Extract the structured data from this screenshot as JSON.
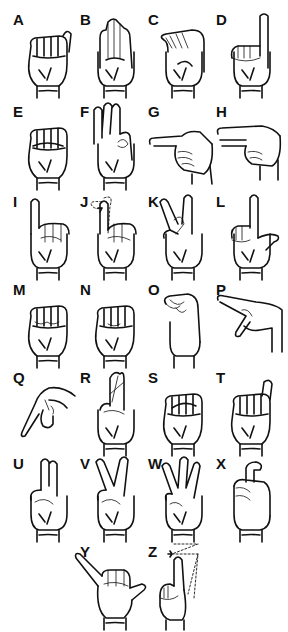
{
  "letters": {
    "A": {
      "label": "A",
      "shape": "fist-thumb-side"
    },
    "B": {
      "label": "B",
      "shape": "flat-hand-thumb-across"
    },
    "C": {
      "label": "C",
      "shape": "curved-c"
    },
    "D": {
      "label": "D",
      "shape": "index-up-circle"
    },
    "E": {
      "label": "E",
      "shape": "fingers-curled-over-thumb"
    },
    "F": {
      "label": "F",
      "shape": "three-fingers-up-ok"
    },
    "G": {
      "label": "G",
      "shape": "index-point-side"
    },
    "H": {
      "label": "H",
      "shape": "two-fingers-point-side"
    },
    "I": {
      "label": "I",
      "shape": "pinky-up"
    },
    "J": {
      "label": "J",
      "shape": "pinky-up-arc-motion"
    },
    "K": {
      "label": "K",
      "shape": "two-fingers-v-thumb-between"
    },
    "L": {
      "label": "L",
      "shape": "index-up-thumb-out"
    },
    "M": {
      "label": "M",
      "shape": "three-fingers-over-thumb"
    },
    "N": {
      "label": "N",
      "shape": "two-fingers-over-thumb"
    },
    "O": {
      "label": "O",
      "shape": "fingers-touch-thumb-o"
    },
    "P": {
      "label": "P",
      "shape": "k-pointing-down"
    },
    "Q": {
      "label": "Q",
      "shape": "g-pointing-down"
    },
    "R": {
      "label": "R",
      "shape": "crossed-fingers"
    },
    "S": {
      "label": "S",
      "shape": "fist-thumb-front"
    },
    "T": {
      "label": "T",
      "shape": "thumb-between-index-middle"
    },
    "U": {
      "label": "U",
      "shape": "two-fingers-together-up"
    },
    "V": {
      "label": "V",
      "shape": "two-fingers-spread-up"
    },
    "W": {
      "label": "W",
      "shape": "three-fingers-spread-up"
    },
    "X": {
      "label": "X",
      "shape": "index-hooked"
    },
    "Y": {
      "label": "Y",
      "shape": "thumb-and-pinky-out"
    },
    "Z": {
      "label": "Z",
      "shape": "index-up-z-motion"
    }
  }
}
